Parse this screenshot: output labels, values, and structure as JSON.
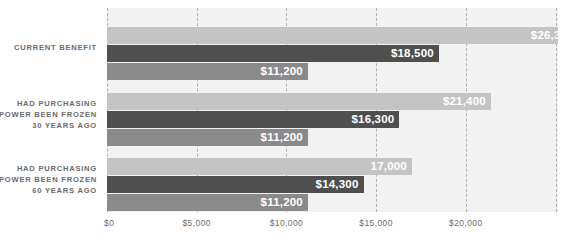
{
  "chart_data": {
    "type": "bar",
    "orientation": "horizontal",
    "title": "",
    "subtitle": "",
    "xlabel": "",
    "ylabel": "",
    "xlim": [
      0,
      25150
    ],
    "grid": true,
    "legend_position": "none",
    "categories": [
      "CURRENT BENEFIT",
      "HAD PURCHASING POWER BEEN FROZEN 30 YEARS AGO",
      "HAD PURCHASING POWER BEEN FROZEN 60 YEARS AGO"
    ],
    "category_lines": [
      [
        "CURRENT BENEFIT"
      ],
      [
        "HAD PURCHASING",
        "POWER BEEN FROZEN",
        "30 YEARS AGO"
      ],
      [
        "HAD PURCHASING",
        "POWER BEEN FROZEN",
        "60 YEARS AGO"
      ]
    ],
    "series": [
      {
        "name": "light",
        "color": "#c4c4c4",
        "values": [
          26300,
          21400,
          17000
        ]
      },
      {
        "name": "dark",
        "color": "#4f4f4f",
        "values": [
          18500,
          16300,
          14300
        ]
      },
      {
        "name": "medium",
        "color": "#8a8a8a",
        "values": [
          11200,
          11200,
          11200
        ]
      }
    ],
    "bar_labels": [
      [
        "$26,300",
        "$18,500",
        "$11,200"
      ],
      [
        "$21,400",
        "$16,300",
        "$11,200"
      ],
      [
        "17,000",
        "$14,300",
        "$11,200"
      ]
    ],
    "xticks": [
      0,
      5000,
      10000,
      15000,
      20000
    ],
    "xtick_labels": [
      "$0",
      "$5,000",
      "$10,000",
      "$15,000",
      "$20,000"
    ]
  },
  "colors": {
    "panel_background": "#f2f2f2",
    "page_background": "#ffffff",
    "gridline": "#b0b0b0",
    "category_text": "#6b6b6b",
    "tick_text": "#6d6d6d",
    "bar_label_text": "#ffffff"
  }
}
